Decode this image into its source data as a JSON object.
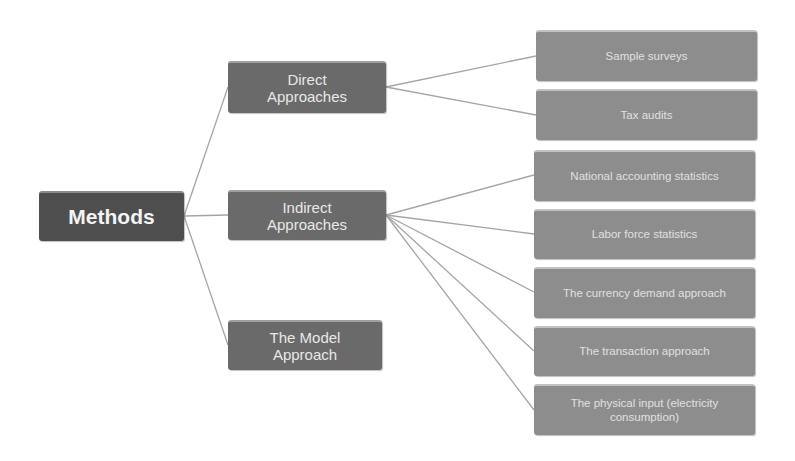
{
  "colors": {
    "root_fill": "#4e4e4e",
    "mid_fill": "#6a6a6a",
    "leaf_fill": "#8d8d8d",
    "connector": "#a5a5a5",
    "background": "#ffffff"
  },
  "root": {
    "label": "Methods"
  },
  "branches": [
    {
      "label": "Direct Approaches",
      "children": [
        "Sample surveys",
        "Tax audits"
      ]
    },
    {
      "label": "Indirect Approaches",
      "children": [
        "National accounting statistics",
        "Labor force statistics",
        "The currency demand approach",
        "The transaction approach",
        "The physical input (electricity consumption)"
      ]
    },
    {
      "label": "The Model Approach",
      "children": []
    }
  ]
}
